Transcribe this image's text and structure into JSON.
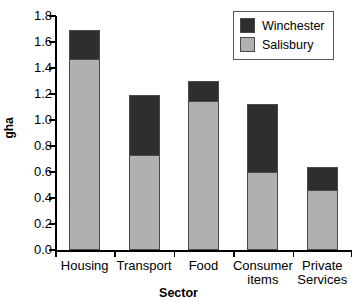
{
  "chart_data": {
    "type": "bar",
    "subtype": "stacked",
    "title": "",
    "xlabel": "Sector",
    "ylabel": "gha",
    "categories": [
      "Housing",
      "Transport",
      "Food",
      "Consumer items",
      "Private Services"
    ],
    "series": [
      {
        "name": "Salisbury",
        "color": "#b0b0b0",
        "values": [
          1.47,
          0.73,
          1.15,
          0.6,
          0.46
        ]
      },
      {
        "name": "Winchester",
        "color": "#2e2e2e",
        "values": [
          0.22,
          0.46,
          0.15,
          0.52,
          0.18
        ]
      }
    ],
    "stack_totals": [
      1.69,
      1.19,
      1.3,
      1.12,
      0.64
    ],
    "ylim": [
      0.0,
      1.8
    ],
    "ytick_step": 0.2,
    "ytick_labels": [
      "0.0",
      "0.2",
      "0.4",
      "0.6",
      "0.8",
      "1.0",
      "1.2",
      "1.4",
      "1.6",
      "1.8"
    ],
    "ytick_values": [
      0.0,
      0.2,
      0.4,
      0.6,
      0.8,
      1.0,
      1.2,
      1.4,
      1.6,
      1.8
    ],
    "grid": false,
    "legend_position": "top-right",
    "legend_entries": [
      {
        "label": "Winchester",
        "color": "#2e2e2e"
      },
      {
        "label": "Salisbury",
        "color": "#b0b0b0"
      }
    ]
  },
  "axes": {
    "y_title": "gha",
    "x_title": "Sector"
  },
  "colors": {
    "winchester": "#2e2e2e",
    "salisbury": "#b0b0b0",
    "axis": "#000000",
    "bar_outline": "#4a4a4a",
    "background": "#ffffff"
  }
}
